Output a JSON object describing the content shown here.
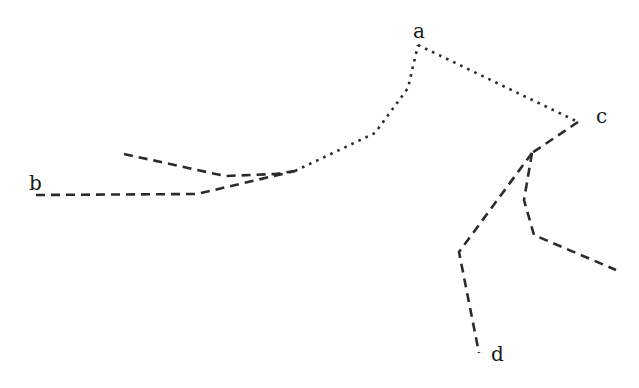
{
  "diagram": {
    "type": "graph-paths",
    "colors": {
      "background": "#ffffff",
      "stroke": "#2b2b2b",
      "text": "#1a1a1a"
    },
    "nodes": [
      {
        "id": "a",
        "label": "a",
        "x": 413,
        "y": 38
      },
      {
        "id": "b",
        "label": "b",
        "x": 29,
        "y": 190
      },
      {
        "id": "c",
        "label": "c",
        "x": 596,
        "y": 123
      },
      {
        "id": "d",
        "label": "d",
        "x": 491,
        "y": 361
      }
    ],
    "paths": [
      {
        "id": "b-lower-dashed",
        "style": "dashed",
        "points": "36,195 197,194 295,171"
      },
      {
        "id": "upper-stub-dashed",
        "style": "dashed",
        "points": "124,154 225,176 275,174 295,171"
      },
      {
        "id": "junction-to-a-dotted",
        "style": "dotted",
        "points": "295,171 375,133 408,88 418,45"
      },
      {
        "id": "a-to-c-dotted",
        "style": "dotted",
        "points": "418,45 578,122"
      },
      {
        "id": "c-to-fork-dashed",
        "style": "dashed",
        "points": "578,122 532,153"
      },
      {
        "id": "fork-to-d-dashed",
        "style": "dashed",
        "points": "532,153 459,252 479,353"
      },
      {
        "id": "fork-to-right-dashed",
        "style": "dashed",
        "points": "532,153 524,200 534,235 616,270"
      }
    ]
  }
}
